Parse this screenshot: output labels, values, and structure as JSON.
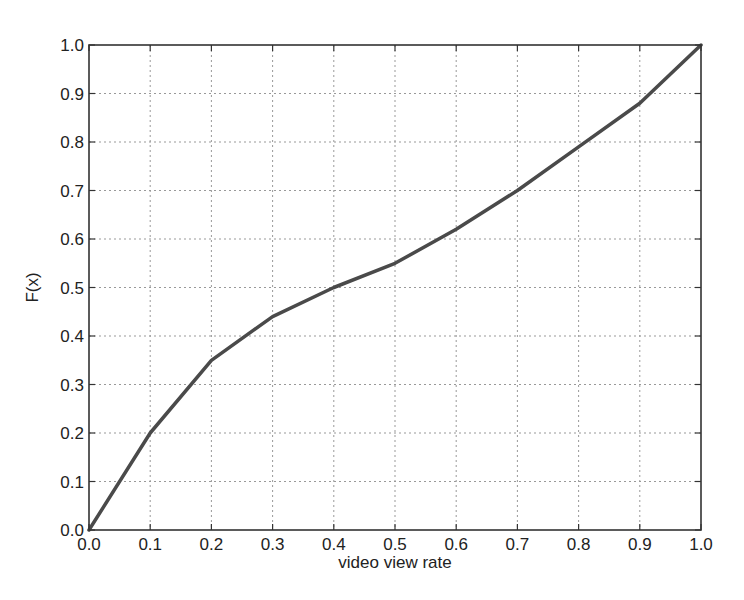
{
  "chart_data": {
    "type": "line",
    "title": "",
    "xlabel": "video view rate",
    "ylabel": "F(x)",
    "xlim": [
      0.0,
      1.0
    ],
    "ylim": [
      0.0,
      1.0
    ],
    "grid": true,
    "legend": null,
    "x_ticks": [
      "0.0",
      "0.1",
      "0.2",
      "0.3",
      "0.4",
      "0.5",
      "0.6",
      "0.7",
      "0.8",
      "0.9",
      "1.0"
    ],
    "y_ticks": [
      "0.0",
      "0.1",
      "0.2",
      "0.3",
      "0.4",
      "0.5",
      "0.6",
      "0.7",
      "0.8",
      "0.9",
      "1.0"
    ],
    "series": [
      {
        "name": "CDF",
        "color": "#4a4a4a",
        "x": [
          0.0,
          0.1,
          0.2,
          0.3,
          0.4,
          0.5,
          0.6,
          0.7,
          0.8,
          0.9,
          1.0
        ],
        "y": [
          0.0,
          0.2,
          0.35,
          0.44,
          0.5,
          0.55,
          0.62,
          0.7,
          0.79,
          0.88,
          1.0
        ]
      }
    ]
  },
  "layout": {
    "plot_left": 89,
    "plot_top": 45,
    "plot_width": 612,
    "plot_height": 485
  }
}
